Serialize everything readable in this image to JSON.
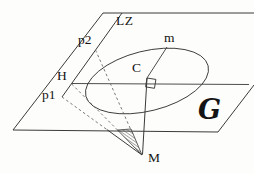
{
  "figure": {
    "type": "geometry-diagram",
    "labels": {
      "axis_lz": "LZ",
      "point_p2": "p2",
      "point_h": "H",
      "point_p1": "p1",
      "mass_m": "m",
      "center_c": "C",
      "plane_g": "G",
      "apex_m": "M"
    },
    "colors": {
      "line": "#3a3a3a",
      "dash": "#6a6a6a",
      "text": "#141414",
      "background": "#fdfdfb"
    }
  }
}
